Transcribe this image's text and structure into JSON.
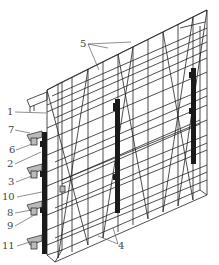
{
  "figure": {
    "type": "technical-diagram",
    "colors": {
      "line": "#222222",
      "column": "#1a1a1a",
      "label": "#444444",
      "background": "#ffffff"
    }
  },
  "labels": [
    {
      "id": "1",
      "text": "1",
      "x": 7,
      "y": 107
    },
    {
      "id": "2",
      "text": "2",
      "x": 7,
      "y": 159
    },
    {
      "id": "3",
      "text": "3",
      "x": 8,
      "y": 177
    },
    {
      "id": "4",
      "text": "4",
      "x": 118,
      "y": 241
    },
    {
      "id": "5",
      "text": "5",
      "x": 80,
      "y": 39
    },
    {
      "id": "6",
      "text": "6",
      "x": 9,
      "y": 145
    },
    {
      "id": "7",
      "text": "7",
      "x": 8,
      "y": 125
    },
    {
      "id": "8",
      "text": "8",
      "x": 7,
      "y": 208
    },
    {
      "id": "9",
      "text": "9",
      "x": 7,
      "y": 221
    },
    {
      "id": "10",
      "text": "10",
      "x": 2,
      "y": 192
    },
    {
      "id": "11",
      "text": "11",
      "x": 2,
      "y": 241
    }
  ]
}
